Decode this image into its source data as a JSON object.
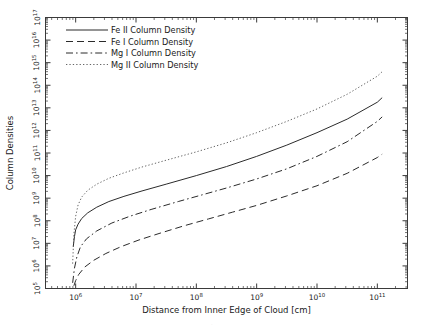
{
  "figure": {
    "background_color": "#ffffff",
    "axis_color": "#3a3a3a",
    "text_color": "#1a1a1a",
    "faint_caption": "."
  },
  "chart_data": {
    "type": "line",
    "title": "",
    "xlabel": "Distance from Inner Edge of Cloud [cm]",
    "ylabel": "Column Densities",
    "xscale": "log",
    "yscale": "log",
    "xlim": [
      300000,
      300000000000
    ],
    "ylim": [
      100000,
      100000000000000000
    ],
    "xlim_exp": [
      5.5,
      11.5
    ],
    "ylim_exp": [
      5,
      17
    ],
    "grid": false,
    "legend_position": "upper left",
    "x_tick_labels": [
      "10^6",
      "10^7",
      "10^8",
      "10^9",
      "10^10",
      "10^11"
    ],
    "x_tick_exps": [
      6,
      7,
      8,
      9,
      10,
      11
    ],
    "y_tick_labels": [
      "10^5",
      "10^6",
      "10^7",
      "10^8",
      "10^9",
      "10^10",
      "10^11",
      "10^12",
      "10^13",
      "10^14",
      "10^15",
      "10^16",
      "10^17"
    ],
    "y_tick_exps": [
      5,
      6,
      7,
      8,
      9,
      10,
      11,
      12,
      13,
      14,
      15,
      16,
      17
    ],
    "series": [
      {
        "name": "Fe II Column Density",
        "style": "solid",
        "color": "#2b2b2b",
        "x_exp": [
          5.96,
          5.98,
          6.0,
          6.04,
          6.1,
          6.2,
          6.35,
          6.55,
          6.8,
          7.1,
          7.5,
          8.0,
          8.5,
          9.0,
          9.5,
          10.0,
          10.5,
          11.0,
          11.08
        ],
        "y_exp": [
          6.85,
          7.3,
          7.6,
          7.85,
          8.1,
          8.35,
          8.6,
          8.85,
          9.08,
          9.32,
          9.62,
          10.0,
          10.4,
          10.85,
          11.35,
          11.9,
          12.5,
          13.25,
          13.45
        ]
      },
      {
        "name": "Fe I Column Density",
        "style": "dashed",
        "color": "#2b2b2b",
        "x_exp": [
          5.97,
          6.0,
          6.05,
          6.15,
          6.3,
          6.5,
          6.75,
          7.05,
          7.4,
          7.8,
          8.2,
          8.6,
          9.0,
          9.5,
          10.0,
          10.5,
          11.0,
          11.08
        ],
        "y_exp": [
          5.12,
          5.35,
          5.62,
          5.95,
          6.25,
          6.55,
          6.85,
          7.15,
          7.45,
          7.78,
          8.08,
          8.38,
          8.68,
          9.1,
          9.55,
          10.1,
          10.8,
          10.95
        ]
      },
      {
        "name": "Mg I Column Density",
        "style": "dashdot",
        "color": "#2b2b2b",
        "x_exp": [
          5.95,
          5.98,
          6.02,
          6.08,
          6.18,
          6.35,
          6.6,
          6.9,
          7.25,
          7.7,
          8.1,
          8.5,
          9.0,
          9.5,
          10.0,
          10.5,
          11.0,
          11.08
        ],
        "y_exp": [
          5.25,
          5.9,
          6.4,
          6.85,
          7.2,
          7.55,
          7.9,
          8.2,
          8.5,
          8.85,
          9.15,
          9.45,
          9.85,
          10.3,
          10.85,
          11.5,
          12.4,
          12.6
        ]
      },
      {
        "name": "Mg II Column Density",
        "style": "dotted",
        "color": "#4a4a4a",
        "x_exp": [
          5.95,
          5.97,
          6.0,
          6.04,
          6.1,
          6.2,
          6.35,
          6.55,
          6.8,
          7.1,
          7.5,
          8.0,
          8.5,
          9.0,
          9.5,
          10.0,
          10.5,
          11.0,
          11.08
        ],
        "y_exp": [
          6.1,
          7.4,
          8.2,
          8.7,
          9.05,
          9.35,
          9.62,
          9.88,
          10.12,
          10.38,
          10.68,
          11.05,
          11.45,
          11.9,
          12.4,
          12.95,
          13.6,
          14.4,
          14.6
        ]
      }
    ]
  }
}
